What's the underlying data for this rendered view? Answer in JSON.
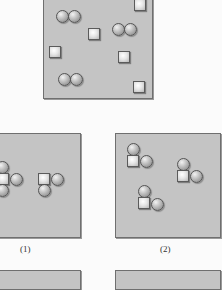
{
  "figure": {
    "top_panel": {
      "description": "mixture of diatomic molecules (two circles) and single atoms (squares)",
      "shapes": [
        {
          "type": "square",
          "x": 134,
          "y": 0
        },
        {
          "type": "circle",
          "x": 56,
          "y": 10
        },
        {
          "type": "circle",
          "x": 68,
          "y": 10
        },
        {
          "type": "square",
          "x": 88,
          "y": 28
        },
        {
          "type": "circle",
          "x": 112,
          "y": 23
        },
        {
          "type": "circle",
          "x": 124,
          "y": 23
        },
        {
          "type": "square",
          "x": 49,
          "y": 46
        },
        {
          "type": "square",
          "x": 118,
          "y": 51
        },
        {
          "type": "circle",
          "x": 58,
          "y": 73
        },
        {
          "type": "circle",
          "x": 70,
          "y": 73
        },
        {
          "type": "square",
          "x": 133,
          "y": 81
        }
      ]
    },
    "options": [
      {
        "label": "(1)"
      },
      {
        "label": "(2)"
      }
    ]
  },
  "colors": {
    "panel_fill": "#c4c4c4",
    "panel_border": "#6f6f6f",
    "background": "#fbfbfb"
  }
}
